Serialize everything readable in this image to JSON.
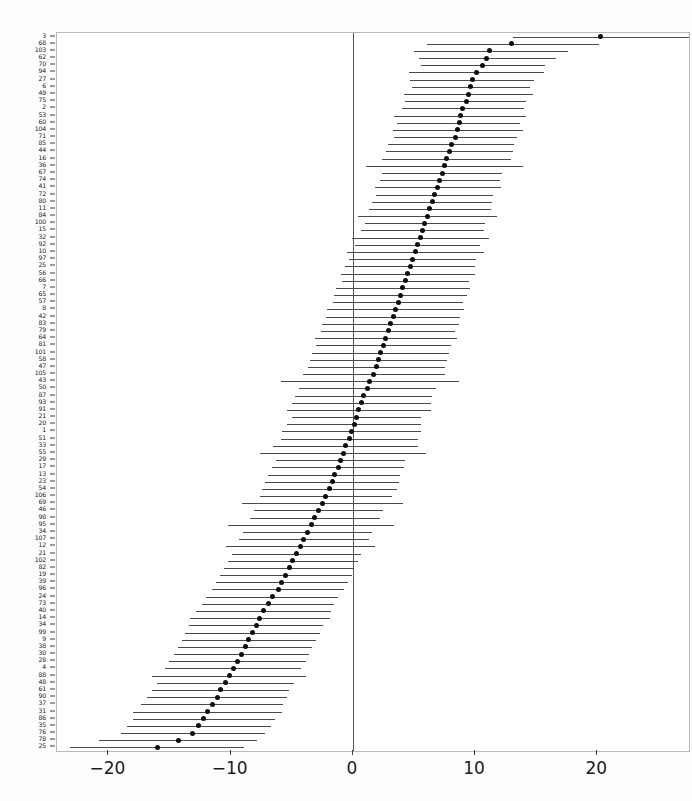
{
  "chart_data": {
    "type": "scatter",
    "title": "",
    "subtitle": "",
    "xlabel": "",
    "ylabel": "",
    "orientation": "horizontal",
    "plot_style": "forest-plot-caterpillar",
    "xlim": [
      -24.2,
      27.5
    ],
    "ylim_rows": 107,
    "grid": false,
    "legend": null,
    "reference_line": 0,
    "xticks": [
      -20,
      -10,
      0,
      10,
      20
    ],
    "xticklabels": [
      "−20",
      "−10",
      "0",
      "10",
      "20"
    ],
    "point_color": "#0d0d0d",
    "interval_color": "#4a4a4a",
    "axis_color": "#3d3d3d",
    "series_name": "random effect estimate with 95% interval",
    "value_key": "estimate",
    "interval_keys": [
      "lower",
      "upper"
    ],
    "rows": [
      {
        "label": "3",
        "estimate": 20.3,
        "lower": 13.1,
        "upper": 27.5
      },
      {
        "label": "68",
        "estimate": 13.0,
        "lower": 6.1,
        "upper": 20.1
      },
      {
        "label": "103",
        "estimate": 11.2,
        "lower": 5.0,
        "upper": 17.6
      },
      {
        "label": "62",
        "estimate": 10.9,
        "lower": 5.4,
        "upper": 16.6
      },
      {
        "label": "70",
        "estimate": 10.6,
        "lower": 5.6,
        "upper": 15.7
      },
      {
        "label": "94",
        "estimate": 10.1,
        "lower": 4.6,
        "upper": 15.6
      },
      {
        "label": "27",
        "estimate": 9.8,
        "lower": 4.7,
        "upper": 14.8
      },
      {
        "label": "6",
        "estimate": 9.6,
        "lower": 4.8,
        "upper": 14.5
      },
      {
        "label": "49",
        "estimate": 9.5,
        "lower": 4.2,
        "upper": 14.7
      },
      {
        "label": "75",
        "estimate": 9.3,
        "lower": 4.3,
        "upper": 14.2
      },
      {
        "label": "2",
        "estimate": 9.0,
        "lower": 4.0,
        "upper": 14.0
      },
      {
        "label": "53",
        "estimate": 8.8,
        "lower": 3.4,
        "upper": 14.2
      },
      {
        "label": "60",
        "estimate": 8.7,
        "lower": 3.6,
        "upper": 13.7
      },
      {
        "label": "104",
        "estimate": 8.6,
        "lower": 3.3,
        "upper": 13.9
      },
      {
        "label": "71",
        "estimate": 8.4,
        "lower": 3.4,
        "upper": 13.4
      },
      {
        "label": "85",
        "estimate": 8.1,
        "lower": 2.9,
        "upper": 13.2
      },
      {
        "label": "44",
        "estimate": 7.9,
        "lower": 2.7,
        "upper": 13.1
      },
      {
        "label": "16",
        "estimate": 7.7,
        "lower": 2.4,
        "upper": 12.9
      },
      {
        "label": "36",
        "estimate": 7.5,
        "lower": 1.1,
        "upper": 13.9
      },
      {
        "label": "67",
        "estimate": 7.3,
        "lower": 2.4,
        "upper": 12.2
      },
      {
        "label": "74",
        "estimate": 7.1,
        "lower": 2.2,
        "upper": 12.0
      },
      {
        "label": "41",
        "estimate": 6.9,
        "lower": 1.8,
        "upper": 12.1
      },
      {
        "label": "72",
        "estimate": 6.7,
        "lower": 1.9,
        "upper": 11.5
      },
      {
        "label": "80",
        "estimate": 6.5,
        "lower": 1.6,
        "upper": 11.4
      },
      {
        "label": "11",
        "estimate": 6.3,
        "lower": 1.3,
        "upper": 11.3
      },
      {
        "label": "84",
        "estimate": 6.1,
        "lower": 0.4,
        "upper": 11.8
      },
      {
        "label": "100",
        "estimate": 5.9,
        "lower": 1.0,
        "upper": 10.8
      },
      {
        "label": "15",
        "estimate": 5.7,
        "lower": 0.7,
        "upper": 10.7
      },
      {
        "label": "32",
        "estimate": 5.5,
        "lower": -0.1,
        "upper": 11.1
      },
      {
        "label": "92",
        "estimate": 5.3,
        "lower": 0.2,
        "upper": 10.4
      },
      {
        "label": "10",
        "estimate": 5.1,
        "lower": -0.5,
        "upper": 10.7
      },
      {
        "label": "97",
        "estimate": 4.9,
        "lower": -0.3,
        "upper": 10.1
      },
      {
        "label": "25",
        "estimate": 4.7,
        "lower": -0.6,
        "upper": 10.0
      },
      {
        "label": "56",
        "estimate": 4.5,
        "lower": -1.0,
        "upper": 10.0
      },
      {
        "label": "66",
        "estimate": 4.3,
        "lower": -0.9,
        "upper": 9.5
      },
      {
        "label": "7",
        "estimate": 4.1,
        "lower": -1.4,
        "upper": 9.6
      },
      {
        "label": "65",
        "estimate": 3.9,
        "lower": -1.5,
        "upper": 9.3
      },
      {
        "label": "57",
        "estimate": 3.7,
        "lower": -1.6,
        "upper": 9.0
      },
      {
        "label": "8",
        "estimate": 3.5,
        "lower": -2.1,
        "upper": 9.1
      },
      {
        "label": "42",
        "estimate": 3.3,
        "lower": -2.2,
        "upper": 8.8
      },
      {
        "label": "83",
        "estimate": 3.1,
        "lower": -2.5,
        "upper": 8.7
      },
      {
        "label": "79",
        "estimate": 2.9,
        "lower": -2.6,
        "upper": 8.4
      },
      {
        "label": "64",
        "estimate": 2.7,
        "lower": -3.1,
        "upper": 8.5
      },
      {
        "label": "81",
        "estimate": 2.5,
        "lower": -3.0,
        "upper": 8.0
      },
      {
        "label": "101",
        "estimate": 2.3,
        "lower": -3.3,
        "upper": 7.9
      },
      {
        "label": "58",
        "estimate": 2.1,
        "lower": -3.5,
        "upper": 7.7
      },
      {
        "label": "47",
        "estimate": 1.9,
        "lower": -3.7,
        "upper": 7.5
      },
      {
        "label": "105",
        "estimate": 1.7,
        "lower": -4.1,
        "upper": 7.5
      },
      {
        "label": "43",
        "estimate": 1.4,
        "lower": -5.9,
        "upper": 8.7
      },
      {
        "label": "50",
        "estimate": 1.2,
        "lower": -4.4,
        "upper": 6.8
      },
      {
        "label": "87",
        "estimate": 0.9,
        "lower": -4.7,
        "upper": 6.5
      },
      {
        "label": "93",
        "estimate": 0.7,
        "lower": -5.0,
        "upper": 6.4
      },
      {
        "label": "91",
        "estimate": 0.5,
        "lower": -5.4,
        "upper": 6.4
      },
      {
        "label": "21",
        "estimate": 0.3,
        "lower": -5.0,
        "upper": 5.6
      },
      {
        "label": "20",
        "estimate": 0.1,
        "lower": -5.4,
        "upper": 5.6
      },
      {
        "label": "1",
        "estimate": -0.1,
        "lower": -5.8,
        "upper": 5.6
      },
      {
        "label": "51",
        "estimate": -0.3,
        "lower": -5.9,
        "upper": 5.3
      },
      {
        "label": "33",
        "estimate": -0.6,
        "lower": -6.5,
        "upper": 5.3
      },
      {
        "label": "55",
        "estimate": -0.8,
        "lower": -7.6,
        "upper": 6.0
      },
      {
        "label": "29",
        "estimate": -1.0,
        "lower": -6.3,
        "upper": 4.3
      },
      {
        "label": "17",
        "estimate": -1.2,
        "lower": -6.6,
        "upper": 4.2
      },
      {
        "label": "13",
        "estimate": -1.5,
        "lower": -6.9,
        "upper": 3.9
      },
      {
        "label": "23",
        "estimate": -1.7,
        "lower": -7.2,
        "upper": 3.8
      },
      {
        "label": "54",
        "estimate": -1.9,
        "lower": -7.4,
        "upper": 3.6
      },
      {
        "label": "106",
        "estimate": -2.2,
        "lower": -7.6,
        "upper": 3.2
      },
      {
        "label": "69",
        "estimate": -2.5,
        "lower": -9.1,
        "upper": 4.1
      },
      {
        "label": "46",
        "estimate": -2.8,
        "lower": -8.1,
        "upper": 2.5
      },
      {
        "label": "98",
        "estimate": -3.1,
        "lower": -8.4,
        "upper": 2.2
      },
      {
        "label": "95",
        "estimate": -3.4,
        "lower": -10.2,
        "upper": 3.4
      },
      {
        "label": "34",
        "estimate": -3.7,
        "lower": -9.0,
        "upper": 1.6
      },
      {
        "label": "107",
        "estimate": -4.0,
        "lower": -9.3,
        "upper": 1.3
      },
      {
        "label": "12",
        "estimate": -4.3,
        "lower": -10.4,
        "upper": 1.8
      },
      {
        "label": "21b",
        "estimate": -4.6,
        "lower": -9.9,
        "upper": 0.7
      },
      {
        "label": "102",
        "estimate": -4.9,
        "lower": -10.2,
        "upper": 0.4
      },
      {
        "label": "82",
        "estimate": -5.2,
        "lower": -10.5,
        "upper": 0.1
      },
      {
        "label": "19",
        "estimate": -5.5,
        "lower": -10.9,
        "upper": -0.1
      },
      {
        "label": "39",
        "estimate": -5.8,
        "lower": -11.2,
        "upper": -0.4
      },
      {
        "label": "96",
        "estimate": -6.1,
        "lower": -11.5,
        "upper": -0.7
      },
      {
        "label": "24",
        "estimate": -6.6,
        "lower": -12.0,
        "upper": -1.2
      },
      {
        "label": "73",
        "estimate": -6.9,
        "lower": -12.3,
        "upper": -1.5
      },
      {
        "label": "40",
        "estimate": -7.3,
        "lower": -12.8,
        "upper": -1.8
      },
      {
        "label": "14",
        "estimate": -7.6,
        "lower": -13.3,
        "upper": -1.9
      },
      {
        "label": "34b",
        "estimate": -7.9,
        "lower": -13.4,
        "upper": -2.4
      },
      {
        "label": "99",
        "estimate": -8.2,
        "lower": -13.7,
        "upper": -2.7
      },
      {
        "label": "9",
        "estimate": -8.5,
        "lower": -14.0,
        "upper": -3.0
      },
      {
        "label": "38",
        "estimate": -8.8,
        "lower": -14.3,
        "upper": -3.3
      },
      {
        "label": "30",
        "estimate": -9.1,
        "lower": -14.6,
        "upper": -3.6
      },
      {
        "label": "28",
        "estimate": -9.4,
        "lower": -15.0,
        "upper": -3.8
      },
      {
        "label": "4",
        "estimate": -9.8,
        "lower": -15.4,
        "upper": -4.2
      },
      {
        "label": "88",
        "estimate": -10.1,
        "lower": -16.4,
        "upper": -3.8
      },
      {
        "label": "48",
        "estimate": -10.4,
        "lower": -16.0,
        "upper": -4.8
      },
      {
        "label": "61",
        "estimate": -10.8,
        "lower": -16.4,
        "upper": -5.2
      },
      {
        "label": "90",
        "estimate": -11.1,
        "lower": -16.8,
        "upper": -5.4
      },
      {
        "label": "37",
        "estimate": -11.5,
        "lower": -17.3,
        "upper": -5.7
      },
      {
        "label": "31",
        "estimate": -11.9,
        "lower": -18.0,
        "upper": -5.8
      },
      {
        "label": "86",
        "estimate": -12.2,
        "lower": -18.0,
        "upper": -6.4
      },
      {
        "label": "35",
        "estimate": -12.6,
        "lower": -18.5,
        "upper": -6.7
      },
      {
        "label": "76",
        "estimate": -13.1,
        "lower": -19.0,
        "upper": -7.2
      },
      {
        "label": "78",
        "estimate": -14.3,
        "lower": -20.8,
        "upper": -7.8
      },
      {
        "label": "25b",
        "estimate": -16.0,
        "lower": -23.1,
        "upper": -8.9
      }
    ]
  },
  "axes": {
    "x_tick_labels": [
      "−20",
      "−10",
      "0",
      "10",
      "20"
    ],
    "x_tick_values": [
      -20,
      -10,
      0,
      10,
      20
    ]
  }
}
